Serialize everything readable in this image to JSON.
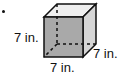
{
  "figure": {
    "type": "cube",
    "edge_labels": {
      "height": "7 in.",
      "depth": "7 in.",
      "width": "7 in."
    },
    "colors": {
      "front_face": "#a9a9a9",
      "top_face": "#efefef",
      "side_face": "#d6d6d6",
      "edges": "#111111"
    }
  }
}
